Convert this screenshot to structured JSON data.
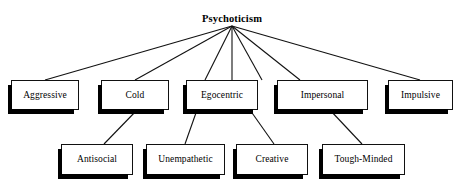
{
  "diagram": {
    "title": "Psychoticism",
    "type": "hierarchy-tree",
    "levels": 3,
    "colors": {
      "background": "#ffffff",
      "box_fill": "#ffffff",
      "box_border": "#111111",
      "shadow": "#000000",
      "line": "#111111",
      "text": "#000000"
    },
    "root": {
      "label": "Psychoticism",
      "x": 232,
      "y": 12,
      "apex_x": 232,
      "apex_y": 26
    },
    "level_1": [
      {
        "id": "aggressive",
        "label": "Aggressive",
        "x": 11,
        "y": 80,
        "w": 68,
        "h": 30
      },
      {
        "id": "cold",
        "label": "Cold",
        "x": 101,
        "y": 80,
        "w": 68,
        "h": 30
      },
      {
        "id": "egocentric",
        "label": "Egocentric",
        "x": 186,
        "y": 80,
        "w": 72,
        "h": 30
      },
      {
        "id": "impersonal",
        "label": "Impersonal",
        "x": 277,
        "y": 80,
        "w": 91,
        "h": 30
      },
      {
        "id": "impulsive",
        "label": "Impulsive",
        "x": 388,
        "y": 80,
        "w": 65,
        "h": 30
      }
    ],
    "level_2": [
      {
        "id": "antisocial",
        "label": "Antisocial",
        "x": 61,
        "y": 144,
        "w": 72,
        "h": 31
      },
      {
        "id": "unempathetic",
        "label": "Unempathetic",
        "x": 146,
        "y": 144,
        "w": 79,
        "h": 31
      },
      {
        "id": "creative",
        "label": "Creative",
        "x": 236,
        "y": 144,
        "w": 72,
        "h": 31
      },
      {
        "id": "tough_minded",
        "label": "Tough-Minded",
        "x": 322,
        "y": 144,
        "w": 83,
        "h": 31
      }
    ],
    "edges_root_to_level1": [
      {
        "from": "psychoticism",
        "to": "aggressive",
        "x1": 232,
        "y1": 26,
        "x2": 45,
        "y2": 80
      },
      {
        "from": "psychoticism",
        "to": "cold",
        "x1": 232,
        "y1": 26,
        "x2": 135,
        "y2": 80
      },
      {
        "from": "psychoticism",
        "to": "egocentric",
        "x1": 232,
        "y1": 26,
        "x2": 205,
        "y2": 80
      },
      {
        "from": "psychoticism",
        "to": "egocentric2",
        "x1": 232,
        "y1": 26,
        "x2": 232,
        "y2": 80
      },
      {
        "from": "psychoticism",
        "to": "impersonal",
        "x1": 232,
        "y1": 26,
        "x2": 262,
        "y2": 80
      },
      {
        "from": "psychoticism",
        "to": "impersonal2",
        "x1": 232,
        "y1": 26,
        "x2": 300,
        "y2": 80
      },
      {
        "from": "psychoticism",
        "to": "impulsive",
        "x1": 232,
        "y1": 26,
        "x2": 420,
        "y2": 80
      }
    ],
    "edges_level1_to_level2": [
      {
        "from": "cold",
        "to": "antisocial",
        "x1": 137,
        "y1": 110,
        "x2": 104,
        "y2": 144
      },
      {
        "from": "egocentric",
        "to": "unempathetic",
        "x1": 197,
        "y1": 110,
        "x2": 185,
        "y2": 144
      },
      {
        "from": "egocentric",
        "to": "creative",
        "x1": 250,
        "y1": 110,
        "x2": 274,
        "y2": 144
      },
      {
        "from": "impersonal",
        "to": "tough_minded",
        "x1": 330,
        "y1": 110,
        "x2": 362,
        "y2": 144
      }
    ]
  }
}
